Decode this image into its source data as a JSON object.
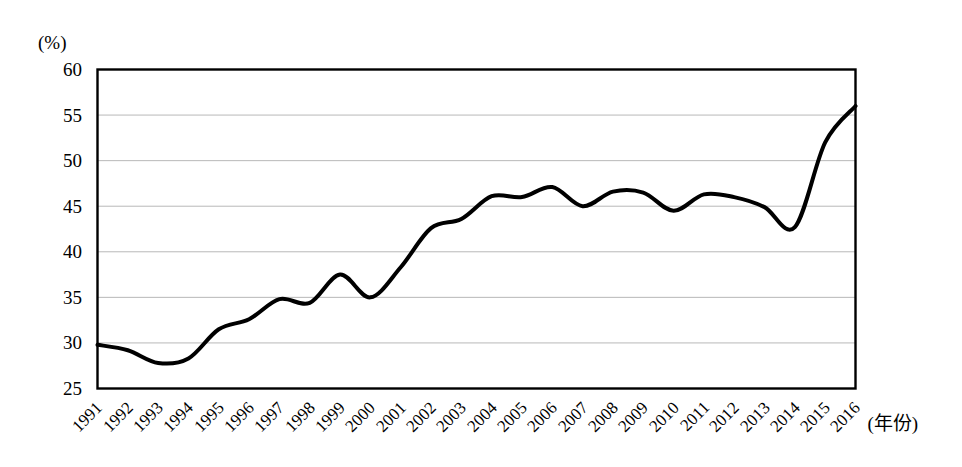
{
  "chart_data": {
    "type": "line",
    "title": "",
    "subtitle": "",
    "xlabel": "(年份)",
    "ylabel": "(%)",
    "unit_label": "(%)",
    "grid": true,
    "legend": null,
    "legend_position": "none",
    "xlim": [
      1991,
      2016
    ],
    "ylim": [
      25,
      60
    ],
    "yticks": [
      60,
      55,
      50,
      45,
      40,
      35,
      30,
      25
    ],
    "ytick_labels": [
      "60",
      "55",
      "50",
      "45",
      "40",
      "35",
      "30",
      "25"
    ],
    "categories": [
      1991,
      1992,
      1993,
      1994,
      1995,
      1996,
      1997,
      1998,
      1999,
      2000,
      2001,
      2002,
      2003,
      2004,
      2005,
      2006,
      2007,
      2008,
      2009,
      2010,
      2011,
      2012,
      2013,
      2014,
      2015,
      2016
    ],
    "xtick_labels": [
      "1991",
      "1992",
      "1993",
      "1994",
      "1995",
      "1996",
      "1997",
      "1998",
      "1999",
      "2000",
      "2001",
      "2002",
      "2003",
      "2004",
      "2005",
      "2006",
      "2007",
      "2008",
      "2009",
      "2010",
      "2011",
      "2012",
      "2013",
      "2014",
      "2015",
      "2016"
    ],
    "values": [
      29.8,
      29.2,
      27.8,
      28.3,
      31.5,
      32.6,
      34.8,
      34.4,
      37.5,
      35.0,
      38.3,
      42.6,
      43.6,
      46.1,
      46.0,
      47.1,
      45.0,
      46.6,
      46.5,
      44.5,
      46.3,
      46.0,
      44.9,
      42.7,
      52.0,
      56.0
    ],
    "series": [
      {
        "name": "",
        "color": "#000000",
        "line_width": 4,
        "values": [
          29.8,
          29.2,
          27.8,
          28.3,
          31.5,
          32.6,
          34.8,
          34.4,
          37.5,
          35.0,
          38.3,
          42.6,
          43.6,
          46.1,
          46.0,
          47.1,
          45.0,
          46.6,
          46.5,
          44.5,
          46.3,
          46.0,
          44.9,
          42.7,
          52.0,
          56.0
        ]
      }
    ]
  },
  "style": {
    "background": "#ffffff",
    "frame_color": "#000000",
    "grid_color": "#b8b8b8",
    "line_color": "#000000"
  }
}
